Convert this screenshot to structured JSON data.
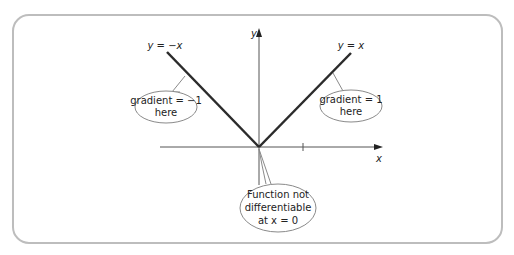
{
  "diagram": {
    "axes": {
      "y_label": "y",
      "x_label": "x"
    },
    "lines": {
      "left_label": "y = −x",
      "right_label": "y = x"
    },
    "callouts": {
      "left": {
        "line1": "gradient = −1",
        "line2": "here"
      },
      "right": {
        "line1": "gradient = 1",
        "line2": "here"
      },
      "bottom": {
        "line1": "Function not",
        "line2": "differentiable",
        "line3": "at x = 0"
      }
    },
    "colors": {
      "frame": "#bdbdbd",
      "lines": "#2b2b2b",
      "axes": "#555555",
      "callout_border": "#8a8a8a"
    }
  }
}
